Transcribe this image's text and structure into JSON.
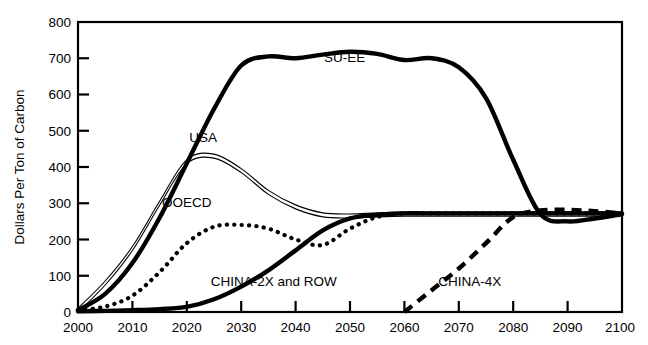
{
  "chart_data": {
    "type": "line",
    "title": "",
    "xlabel": "",
    "ylabel": "Dollars Per Ton of Carbon",
    "xlim": [
      2000,
      2100
    ],
    "ylim": [
      0,
      800
    ],
    "grid": false,
    "legend_position": "inline-annotations",
    "xticks": [
      "2000",
      "2010",
      "2020",
      "2030",
      "2040",
      "2050",
      "2060",
      "2070",
      "2080",
      "2090",
      "2100"
    ],
    "yticks": [
      "0",
      "100",
      "200",
      "300",
      "400",
      "500",
      "600",
      "700",
      "800"
    ],
    "x": [
      2000,
      2005,
      2010,
      2015,
      2020,
      2025,
      2030,
      2035,
      2040,
      2045,
      2050,
      2055,
      2060,
      2065,
      2070,
      2075,
      2080,
      2085,
      2090,
      2095,
      2100
    ],
    "series": [
      {
        "name": "SU-EE",
        "style": "thick-solid",
        "color": "#000000",
        "label_x": 2049,
        "label_y": 690,
        "values": [
          5,
          50,
          135,
          260,
          410,
          560,
          680,
          705,
          700,
          710,
          718,
          712,
          695,
          700,
          675,
          590,
          420,
          270,
          250,
          258,
          270
        ]
      },
      {
        "name": "USA",
        "style": "double-thin-solid",
        "color": "#000000",
        "label_x": 2023,
        "label_y": 470,
        "values": [
          5,
          80,
          175,
          300,
          415,
          430,
          390,
          330,
          290,
          268,
          265,
          268,
          270,
          270,
          270,
          270,
          270,
          270,
          270,
          270,
          270
        ]
      },
      {
        "name": "OOECD",
        "style": "dotted",
        "color": "#000000",
        "label_x": 2020,
        "label_y": 290,
        "values": [
          5,
          15,
          45,
          110,
          190,
          235,
          240,
          230,
          200,
          185,
          230,
          262,
          272,
          272,
          272,
          272,
          272,
          272,
          272,
          272,
          272
        ]
      },
      {
        "name": "CHINA-2X and ROW",
        "style": "thick-solid",
        "color": "#000000",
        "label_x": 2036,
        "label_y": 72,
        "values": [
          2,
          3,
          5,
          8,
          14,
          35,
          70,
          115,
          170,
          225,
          258,
          268,
          272,
          272,
          272,
          272,
          272,
          272,
          272,
          272,
          272
        ]
      },
      {
        "name": "CHINA-4X",
        "style": "dashed",
        "color": "#000000",
        "label_x": 2072,
        "label_y": 72,
        "values": [
          null,
          null,
          null,
          null,
          null,
          null,
          null,
          null,
          null,
          null,
          null,
          null,
          0,
          60,
          120,
          190,
          262,
          280,
          282,
          278,
          272
        ]
      }
    ],
    "annotations": [
      {
        "text": "SU-EE",
        "x": 2049,
        "y": 690
      },
      {
        "text": "USA",
        "x": 2023,
        "y": 470
      },
      {
        "text": "OOECD",
        "x": 2020,
        "y": 290
      },
      {
        "text": "CHINA-2X and ROW",
        "x": 2036,
        "y": 72
      },
      {
        "text": "CHINA-4X",
        "x": 2072,
        "y": 72
      }
    ]
  },
  "axes": {
    "y_title": "Dollars Per Ton of Carbon",
    "y_tick_0": "0",
    "y_tick_1": "100",
    "y_tick_2": "200",
    "y_tick_3": "300",
    "y_tick_4": "400",
    "y_tick_5": "500",
    "y_tick_6": "600",
    "y_tick_7": "700",
    "y_tick_8": "800",
    "x_tick_0": "2000",
    "x_tick_1": "2010",
    "x_tick_2": "2020",
    "x_tick_3": "2030",
    "x_tick_4": "2040",
    "x_tick_5": "2050",
    "x_tick_6": "2060",
    "x_tick_7": "2070",
    "x_tick_8": "2080",
    "x_tick_9": "2090",
    "x_tick_10": "2100"
  },
  "labels": {
    "su_ee": "SU-EE",
    "usa": "USA",
    "ooecd": "OOECD",
    "china_2x": "CHINA-2X and ROW",
    "china_4x": "CHINA-4X"
  },
  "colors": {
    "line": "#000000",
    "axis": "#000000",
    "background": "#ffffff"
  }
}
